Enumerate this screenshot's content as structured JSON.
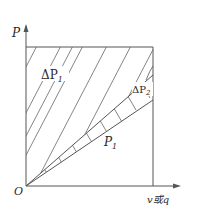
{
  "diagram": {
    "y_axis_label": "P",
    "x_axis_label": "v或q",
    "origin_label": "O",
    "regions": {
      "upper_hatched": {
        "label": "ΔP",
        "sub": "1"
      },
      "band": {
        "label": "ΔP",
        "sub": "2"
      },
      "lower": {
        "label": "P",
        "sub": "1"
      }
    },
    "colors": {
      "line": "#555555",
      "text": "#2a2a2a",
      "background": "#ffffff"
    }
  }
}
